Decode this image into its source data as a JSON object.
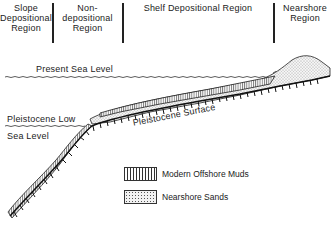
{
  "regions": [
    {
      "name": "slope",
      "label": "Slope Depositional Region"
    },
    {
      "name": "non-depositional",
      "label": "Non-depositional Region"
    },
    {
      "name": "shelf",
      "label": "Shelf Depositional Region"
    },
    {
      "name": "nearshore",
      "label": "Nearshore Region"
    }
  ],
  "labels": {
    "slope_l1": "Slope",
    "slope_l2": "Depositional",
    "slope_l3": "Region",
    "nondep_l1": "Non-depositional",
    "nondep_l2": "Region",
    "shelf": "Shelf  Depositional  Region",
    "near_l1": "Nearshore",
    "near_l2": "Region",
    "present_sea_level": "Present  Sea  Level",
    "pleist_low_l1": "Pleistocene  Low",
    "pleist_low_l2": "Sea  Level",
    "pleist_surface": "Pleistocene  Surface"
  },
  "legend": [
    {
      "pattern": "vertical-hatch",
      "label": "Modern  Offshore  Muds"
    },
    {
      "pattern": "stipple",
      "label": "Nearshore  Sands"
    }
  ],
  "colors": {
    "ink": "#222222",
    "background": "#ffffff"
  }
}
